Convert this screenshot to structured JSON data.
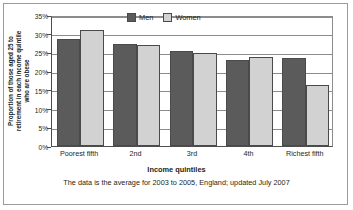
{
  "chart_data": {
    "type": "bar",
    "title": "",
    "categories": [
      "Poorest fifth",
      "2nd",
      "3rd",
      "4th",
      "Richest fifth"
    ],
    "series": [
      {
        "name": "Men",
        "color": "#5b5b5b",
        "values": [
          28.5,
          27.2,
          25.5,
          23.1,
          23.4
        ]
      },
      {
        "name": "Women",
        "color": "#d2d2d2",
        "values": [
          31.0,
          27.1,
          24.8,
          23.9,
          16.3
        ]
      }
    ],
    "xlabel": "Income quintiles",
    "ylabel_lines": [
      "Proportion of those aged 25 to",
      "retirement in each income quintile",
      "who are obese"
    ],
    "ylabel": "Proportion of those aged 25 to retirement in each income quintile who are obese",
    "ylim": [
      0,
      35
    ],
    "ytick_values": [
      0,
      5,
      10,
      15,
      20,
      25,
      30,
      35
    ],
    "ytick_labels": [
      "0%",
      "5%",
      "10%",
      "15%",
      "20%",
      "25%",
      "30%",
      "35%"
    ],
    "grid": true,
    "legend_position": "top-center",
    "caption": "The data is the average for 2003 to 2005, England; updated July 2007"
  }
}
